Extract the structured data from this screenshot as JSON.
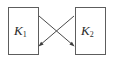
{
  "figure": {
    "type": "node-edge-diagram",
    "background_color": "#ffffff",
    "stroke_color": "#4a4a4a",
    "box_stroke_color": "#5d5d5d",
    "label_color": "#2b2b2b",
    "width": 115,
    "height": 62
  },
  "nodes": [
    {
      "id": "k1",
      "base": "K",
      "subscript": "1",
      "text": "K1",
      "x": 8,
      "y": 7,
      "width": 30,
      "height": 48
    },
    {
      "id": "k2",
      "base": "K",
      "subscript": "2",
      "text": "K2",
      "x": 75,
      "y": 7,
      "width": 31,
      "height": 48
    }
  ],
  "edges": [
    {
      "id": "k1-to-k2",
      "from": "k1",
      "to": "k2",
      "direction": "down-right",
      "x1": 39,
      "y1": 16,
      "x2": 74,
      "y2": 46,
      "arrowhead": "end"
    },
    {
      "id": "k2-to-k1",
      "from": "k2",
      "to": "k1",
      "direction": "down-left",
      "x1": 74,
      "y1": 16,
      "x2": 39,
      "y2": 46,
      "arrowhead": "end"
    }
  ]
}
